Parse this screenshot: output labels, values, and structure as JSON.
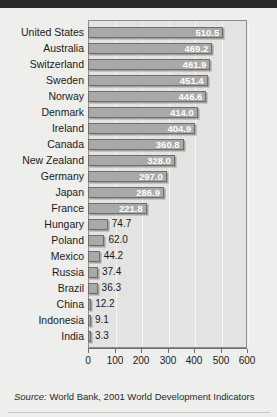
{
  "chart_data": {
    "type": "bar",
    "orientation": "horizontal",
    "title": "",
    "xlabel": "",
    "ylabel": "",
    "xlim": [
      0,
      600
    ],
    "xticks": [
      0,
      100,
      200,
      300,
      400,
      500,
      600
    ],
    "grid": true,
    "legend": false,
    "categories": [
      "United States",
      "Australia",
      "Switzerland",
      "Sweden",
      "Norway",
      "Denmark",
      "Ireland",
      "Canada",
      "New Zealand",
      "Germany",
      "Japan",
      "France",
      "Hungary",
      "Poland",
      "Mexico",
      "Russia",
      "Brazil",
      "China",
      "Indonesia",
      "India"
    ],
    "values": [
      510.5,
      469.2,
      461.9,
      451.4,
      446.6,
      414.0,
      404.9,
      360.8,
      328.0,
      297.0,
      286.9,
      221.8,
      74.7,
      62.0,
      44.2,
      37.4,
      36.3,
      12.2,
      9.1,
      3.3
    ],
    "value_labels": [
      "510.5",
      "469.2",
      "461.9",
      "451.4",
      "446.6",
      "414.0",
      "404.9",
      "360.8",
      "328.0",
      "297.0",
      "286.9",
      "221.8",
      "74.7",
      "62.0",
      "44.2",
      "37.4",
      "36.3",
      "12.2",
      "9.1",
      "3.3"
    ],
    "tick_labels": [
      "0",
      "100",
      "200",
      "300",
      "400",
      "500",
      "600"
    ],
    "colors": {
      "bar_fill": "#a9a9a9",
      "bar_border": "#6e6e6e",
      "plot_background": "#e3e3e1",
      "page_background": "#eeeeec",
      "value_label_inside": "#ffffff",
      "value_label_outside": "#1a1a1a",
      "gridline": "#f7f7f7",
      "top_band": "#2b2b2b"
    }
  },
  "source": {
    "prefix": "Source:",
    "text": "World Bank, 2001 World Development Indicators"
  }
}
